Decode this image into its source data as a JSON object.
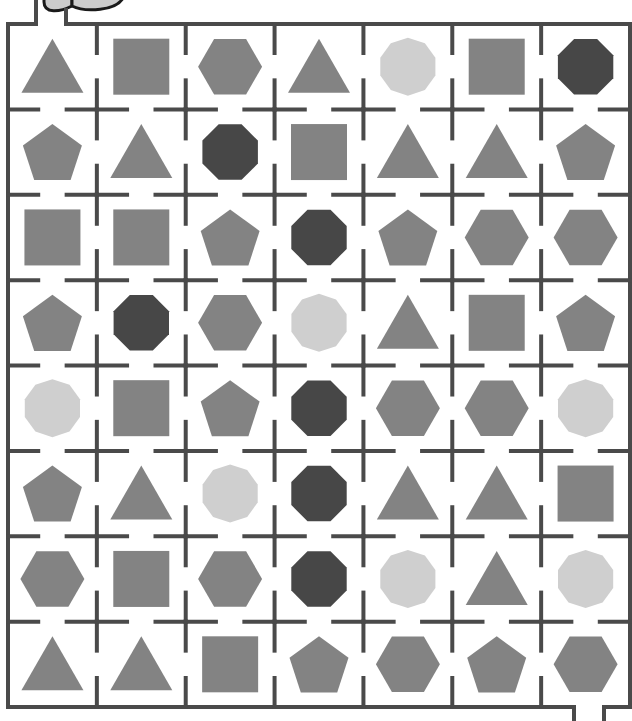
{
  "puzzle": {
    "type": "shape-maze",
    "rows": 8,
    "cols": 7,
    "entry": {
      "position": "top-left",
      "row": 0,
      "col": 0
    },
    "exit": {
      "position": "bottom-right",
      "row": 7,
      "col": 6
    }
  },
  "colors": {
    "background": "#ffffff",
    "wall": "#4a4a4a",
    "shape_mid": "#838383",
    "shape_light": "#cfcfcf",
    "shape_dark": "#474747",
    "start_icon_fill": "#cccccc",
    "start_icon_stroke": "#1a1a1a"
  },
  "legend": {
    "triangle": "mid",
    "square": "mid",
    "pentagon": "mid",
    "hexagon": "mid",
    "octagon": "dark",
    "decagon": "light"
  },
  "grid": [
    [
      "triangle",
      "square",
      "hexagon",
      "triangle",
      "decagon",
      "square",
      "octagon"
    ],
    [
      "pentagon",
      "triangle",
      "octagon",
      "square",
      "triangle",
      "triangle",
      "pentagon"
    ],
    [
      "square",
      "square",
      "pentagon",
      "octagon",
      "pentagon",
      "hexagon",
      "hexagon"
    ],
    [
      "pentagon",
      "octagon",
      "hexagon",
      "decagon",
      "triangle",
      "square",
      "pentagon"
    ],
    [
      "decagon",
      "square",
      "pentagon",
      "octagon",
      "hexagon",
      "hexagon",
      "decagon"
    ],
    [
      "pentagon",
      "triangle",
      "decagon",
      "octagon",
      "triangle",
      "triangle",
      "square"
    ],
    [
      "hexagon",
      "square",
      "hexagon",
      "octagon",
      "decagon",
      "triangle",
      "decagon"
    ],
    [
      "triangle",
      "triangle",
      "square",
      "pentagon",
      "hexagon",
      "pentagon",
      "hexagon"
    ]
  ]
}
